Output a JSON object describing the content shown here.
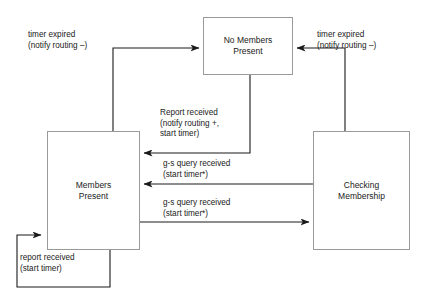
{
  "diagram": {
    "background_color": "#ffffff",
    "box_border_color": "#9a9a9a",
    "arrow_color": "#1a1a1a",
    "states": [
      {
        "id": "no-members-present",
        "label": "No Members\nPresent",
        "x": 203,
        "y": 17,
        "width": 90,
        "height": 58
      },
      {
        "id": "members-present",
        "label": "Members\nPresent",
        "x": 47,
        "y": 131,
        "width": 93,
        "height": 119
      },
      {
        "id": "checking-membership",
        "label": "Checking\nMembership",
        "x": 313,
        "y": 131,
        "width": 97,
        "height": 119
      }
    ],
    "transitions": [
      {
        "id": "members-to-no-members",
        "from": "members-present",
        "to": "no-members-present",
        "label": "timer expired\n(notify routing –)",
        "label_x": 28,
        "label_y": 30
      },
      {
        "id": "checking-to-no-members",
        "from": "checking-membership",
        "to": "no-members-present",
        "label": "timer expired\n(notify routing –)",
        "label_x": 317,
        "label_y": 30
      },
      {
        "id": "no-members-to-members",
        "from": "no-members-present",
        "to": "members-present",
        "label": "Report received\n(notify routing +,\nstart timer)",
        "label_x": 160,
        "label_y": 108
      },
      {
        "id": "checking-to-members",
        "from": "checking-membership",
        "to": "members-present",
        "label": "g-s query received\n(start timer*)",
        "label_x": 163,
        "label_y": 159
      },
      {
        "id": "members-to-checking",
        "from": "members-present",
        "to": "checking-membership",
        "label": "g-s query received\n(start timer*)",
        "label_x": 163,
        "label_y": 198
      },
      {
        "id": "members-self-loop",
        "from": "members-present",
        "to": "members-present",
        "label": "report received\n(start timer)",
        "label_x": 20,
        "label_y": 253
      }
    ]
  }
}
